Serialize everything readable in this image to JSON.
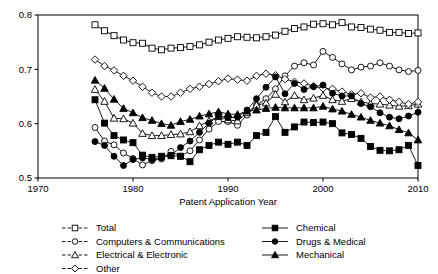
{
  "chart_data": {
    "type": "line",
    "title": "",
    "xlabel": "Patent Application Year",
    "ylabel": "",
    "xlim": [
      1970,
      2010
    ],
    "ylim": [
      0.5,
      0.8
    ],
    "xticks": [
      1970,
      1980,
      1990,
      2000,
      2010
    ],
    "yticks": [
      0.5,
      0.6,
      0.7,
      0.8
    ],
    "ytick_labels": [
      "0.5",
      "0.6",
      "0.7",
      "0.8"
    ],
    "xtick_labels": [
      "1970",
      "1980",
      "1990",
      "2000",
      "2010"
    ],
    "grid": false,
    "legend_position": "below-plot-two-columns",
    "x": [
      1976,
      1977,
      1978,
      1979,
      1980,
      1981,
      1982,
      1983,
      1984,
      1985,
      1986,
      1987,
      1988,
      1989,
      1990,
      1991,
      1992,
      1993,
      1994,
      1995,
      1996,
      1997,
      1998,
      1999,
      2000,
      2001,
      2002,
      2003,
      2004,
      2005,
      2006,
      2007,
      2008,
      2009,
      2010
    ],
    "series": [
      {
        "name": "Total",
        "marker": "square-open",
        "line": "dashed",
        "values": [
          0.782,
          0.771,
          0.762,
          0.754,
          0.749,
          0.748,
          0.739,
          0.736,
          0.739,
          0.74,
          0.742,
          0.745,
          0.75,
          0.754,
          0.757,
          0.76,
          0.759,
          0.758,
          0.76,
          0.763,
          0.77,
          0.775,
          0.778,
          0.783,
          0.784,
          0.782,
          0.786,
          0.778,
          0.777,
          0.774,
          0.772,
          0.768,
          0.768,
          0.766,
          0.767
        ]
      },
      {
        "name": "Computers & Communications",
        "marker": "circle-open",
        "line": "dashed",
        "values": [
          0.593,
          0.568,
          0.561,
          0.546,
          0.536,
          0.524,
          0.532,
          0.535,
          0.549,
          0.54,
          0.55,
          0.57,
          0.59,
          0.604,
          0.604,
          0.597,
          0.616,
          0.634,
          0.646,
          0.664,
          0.688,
          0.706,
          0.712,
          0.708,
          0.733,
          0.722,
          0.71,
          0.699,
          0.704,
          0.706,
          0.712,
          0.706,
          0.699,
          0.696,
          0.698
        ]
      },
      {
        "name": "Electrical & Electronic",
        "marker": "triangle-open",
        "line": "dashed",
        "values": [
          0.663,
          0.641,
          0.61,
          0.609,
          0.601,
          0.582,
          0.578,
          0.578,
          0.58,
          0.581,
          0.585,
          0.596,
          0.605,
          0.613,
          0.607,
          0.605,
          0.62,
          0.634,
          0.638,
          0.654,
          0.64,
          0.652,
          0.644,
          0.647,
          0.652,
          0.644,
          0.641,
          0.646,
          0.64,
          0.637,
          0.636,
          0.634,
          0.632,
          0.633,
          0.636
        ]
      },
      {
        "name": "Other",
        "marker": "diamond-open",
        "line": "dashed",
        "values": [
          0.718,
          0.706,
          0.698,
          0.688,
          0.679,
          0.668,
          0.657,
          0.65,
          0.65,
          0.657,
          0.664,
          0.668,
          0.673,
          0.678,
          0.683,
          0.681,
          0.679,
          0.688,
          0.692,
          0.689,
          0.682,
          0.677,
          0.674,
          0.669,
          0.665,
          0.664,
          0.659,
          0.654,
          0.656,
          0.648,
          0.65,
          0.644,
          0.64,
          0.636,
          0.64
        ]
      },
      {
        "name": "Chemical",
        "marker": "square-filled",
        "line": "solid",
        "values": [
          0.644,
          0.601,
          0.578,
          0.57,
          0.565,
          0.542,
          0.538,
          0.54,
          0.541,
          0.54,
          0.53,
          0.552,
          0.56,
          0.566,
          0.562,
          0.566,
          0.56,
          0.578,
          0.584,
          0.613,
          0.584,
          0.594,
          0.603,
          0.602,
          0.603,
          0.6,
          0.583,
          0.58,
          0.573,
          0.558,
          0.551,
          0.55,
          0.552,
          0.56,
          0.523
        ]
      },
      {
        "name": "Drugs & Medical",
        "marker": "circle-filled",
        "line": "solid",
        "values": [
          0.567,
          0.56,
          0.54,
          0.523,
          0.534,
          0.537,
          0.534,
          0.537,
          0.542,
          0.556,
          0.568,
          0.584,
          0.601,
          0.614,
          0.611,
          0.612,
          0.625,
          0.646,
          0.667,
          0.686,
          0.655,
          0.674,
          0.663,
          0.668,
          0.671,
          0.656,
          0.651,
          0.651,
          0.637,
          0.631,
          0.62,
          0.612,
          0.609,
          0.614,
          0.621
        ]
      },
      {
        "name": "Mechanical",
        "marker": "triangle-filled",
        "line": "solid",
        "values": [
          0.68,
          0.665,
          0.645,
          0.628,
          0.62,
          0.611,
          0.606,
          0.6,
          0.597,
          0.604,
          0.608,
          0.614,
          0.618,
          0.622,
          0.618,
          0.617,
          0.623,
          0.625,
          0.628,
          0.63,
          0.629,
          0.629,
          0.629,
          0.629,
          0.632,
          0.627,
          0.623,
          0.617,
          0.612,
          0.606,
          0.601,
          0.596,
          0.589,
          0.583,
          0.57
        ]
      }
    ]
  },
  "legend": {
    "columns": [
      {
        "items": [
          {
            "label": "Total",
            "marker": "square-open"
          },
          {
            "label": "Computers & Communications",
            "marker": "circle-open"
          },
          {
            "label": "Electrical & Electronic",
            "marker": "triangle-open"
          },
          {
            "label": "Other",
            "marker": "diamond-open"
          }
        ]
      },
      {
        "items": [
          {
            "label": "Chemical",
            "marker": "square-filled"
          },
          {
            "label": "Drugs & Medical",
            "marker": "circle-filled"
          },
          {
            "label": "Mechanical",
            "marker": "triangle-filled"
          }
        ]
      }
    ]
  },
  "colors": {
    "ink": "#000000",
    "background": "#ffffff"
  }
}
